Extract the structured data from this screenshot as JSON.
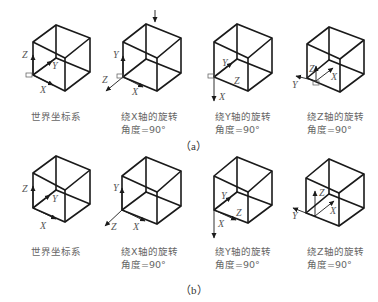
{
  "figure": {
    "rows": [
      {
        "label": "（a）",
        "panels": [
          {
            "caption_line1": "世界坐标系",
            "caption_line2": "",
            "axes": [
              "X",
              "Y",
              "Z"
            ]
          },
          {
            "caption_line1": "绕X轴的旋转",
            "caption_line2": "角度=90°",
            "axes": [
              "X",
              "Y",
              "Z"
            ]
          },
          {
            "caption_line1": "绕Y轴的旋转",
            "caption_line2": "角度=90°",
            "axes": [
              "X",
              "Y",
              "Z"
            ]
          },
          {
            "caption_line1": "绕Z轴的旋转",
            "caption_line2": "角度=90°",
            "axes": [
              "X",
              "Y",
              "Z"
            ]
          }
        ]
      },
      {
        "label": "（b）",
        "panels": [
          {
            "caption_line1": "世界坐标系",
            "caption_line2": "",
            "axes": [
              "X",
              "Y",
              "Z"
            ]
          },
          {
            "caption_line1": "绕X轴的旋转",
            "caption_line2": "角度=90°",
            "axes": [
              "X",
              "Y",
              "Z"
            ]
          },
          {
            "caption_line1": "绕Y轴的旋转",
            "caption_line2": "角度=90°",
            "axes": [
              "X",
              "Y",
              "Z"
            ]
          },
          {
            "caption_line1": "绕Z轴的旋转",
            "caption_line2": "角度=90°",
            "axes": [
              "X",
              "Y",
              "Z"
            ]
          }
        ]
      }
    ]
  }
}
